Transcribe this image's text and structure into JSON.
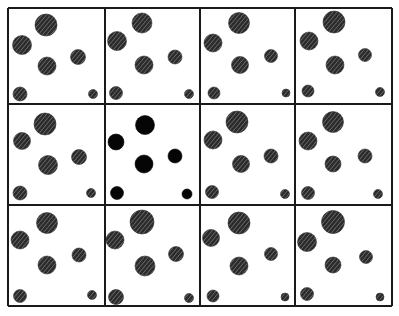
{
  "figure": {
    "rows": 3,
    "cols": 4,
    "frame": {
      "x": 8,
      "y": 8,
      "right": 392,
      "bottom": 306
    },
    "col_lines": [
      8,
      105,
      200,
      295,
      392
    ],
    "row_lines": [
      8,
      104,
      205,
      306
    ],
    "line_color": "#1a1a1a",
    "hatch_fill": "#2b2b2b",
    "hatch_stripe": "#9a9a9a",
    "solid_fill": "#050505"
  },
  "panels": [
    {
      "index": 1,
      "style": "hatched",
      "dots": [
        {
          "cx": 46,
          "cy": 25,
          "r": 11
        },
        {
          "cx": 22,
          "cy": 45,
          "r": 9.5
        },
        {
          "cx": 47,
          "cy": 66,
          "r": 9
        },
        {
          "cx": 78,
          "cy": 57,
          "r": 7.5
        },
        {
          "cx": 20,
          "cy": 94,
          "r": 7
        },
        {
          "cx": 93,
          "cy": 94,
          "r": 4.5
        }
      ]
    },
    {
      "index": 2,
      "style": "hatched",
      "dots": [
        {
          "cx": 142,
          "cy": 23,
          "r": 10
        },
        {
          "cx": 117,
          "cy": 41,
          "r": 9.5
        },
        {
          "cx": 144,
          "cy": 65,
          "r": 9
        },
        {
          "cx": 175,
          "cy": 57,
          "r": 7
        },
        {
          "cx": 116,
          "cy": 93,
          "r": 6.5
        },
        {
          "cx": 189,
          "cy": 94,
          "r": 4.5
        }
      ]
    },
    {
      "index": 3,
      "style": "hatched",
      "dots": [
        {
          "cx": 239,
          "cy": 23,
          "r": 10.5
        },
        {
          "cx": 213,
          "cy": 43,
          "r": 9
        },
        {
          "cx": 240,
          "cy": 65,
          "r": 8.5
        },
        {
          "cx": 271,
          "cy": 56,
          "r": 6.5
        },
        {
          "cx": 214,
          "cy": 93,
          "r": 6
        },
        {
          "cx": 286,
          "cy": 93,
          "r": 4
        }
      ]
    },
    {
      "index": 4,
      "style": "hatched",
      "dots": [
        {
          "cx": 334,
          "cy": 22,
          "r": 11
        },
        {
          "cx": 309,
          "cy": 41,
          "r": 9
        },
        {
          "cx": 335,
          "cy": 65,
          "r": 9
        },
        {
          "cx": 365,
          "cy": 55,
          "r": 6.5
        },
        {
          "cx": 308,
          "cy": 91,
          "r": 6
        },
        {
          "cx": 380,
          "cy": 92,
          "r": 4.5
        }
      ]
    },
    {
      "index": 5,
      "style": "hatched",
      "dots": [
        {
          "cx": 45,
          "cy": 124,
          "r": 11
        },
        {
          "cx": 22,
          "cy": 141,
          "r": 8.5
        },
        {
          "cx": 48,
          "cy": 165,
          "r": 9.5
        },
        {
          "cx": 79,
          "cy": 157,
          "r": 7.5
        },
        {
          "cx": 20,
          "cy": 193,
          "r": 7
        },
        {
          "cx": 91,
          "cy": 193,
          "r": 4.5
        }
      ]
    },
    {
      "index": 6,
      "style": "solid",
      "dots": [
        {
          "cx": 145,
          "cy": 125,
          "r": 9.5
        },
        {
          "cx": 116,
          "cy": 142,
          "r": 8
        },
        {
          "cx": 144,
          "cy": 164,
          "r": 9
        },
        {
          "cx": 175,
          "cy": 156,
          "r": 7
        },
        {
          "cx": 117,
          "cy": 193,
          "r": 6.5
        },
        {
          "cx": 187,
          "cy": 194,
          "r": 5
        }
      ]
    },
    {
      "index": 7,
      "style": "hatched",
      "dots": [
        {
          "cx": 237,
          "cy": 122,
          "r": 11
        },
        {
          "cx": 213,
          "cy": 140,
          "r": 9
        },
        {
          "cx": 241,
          "cy": 164,
          "r": 8.5
        },
        {
          "cx": 271,
          "cy": 156,
          "r": 7
        },
        {
          "cx": 212,
          "cy": 192,
          "r": 6.5
        },
        {
          "cx": 285,
          "cy": 194,
          "r": 4.5
        }
      ]
    },
    {
      "index": 8,
      "style": "hatched",
      "dots": [
        {
          "cx": 333,
          "cy": 122,
          "r": 10.5
        },
        {
          "cx": 308,
          "cy": 141,
          "r": 9
        },
        {
          "cx": 333,
          "cy": 164,
          "r": 8
        },
        {
          "cx": 365,
          "cy": 156,
          "r": 7
        },
        {
          "cx": 308,
          "cy": 193,
          "r": 6.5
        },
        {
          "cx": 378,
          "cy": 194,
          "r": 4.5
        }
      ]
    },
    {
      "index": 9,
      "style": "hatched",
      "dots": [
        {
          "cx": 47,
          "cy": 223,
          "r": 10.5
        },
        {
          "cx": 20,
          "cy": 240,
          "r": 9
        },
        {
          "cx": 47,
          "cy": 265,
          "r": 9
        },
        {
          "cx": 79,
          "cy": 255,
          "r": 7
        },
        {
          "cx": 20,
          "cy": 296,
          "r": 6.5
        },
        {
          "cx": 92,
          "cy": 295,
          "r": 4.5
        }
      ]
    },
    {
      "index": 10,
      "style": "hatched",
      "dots": [
        {
          "cx": 142,
          "cy": 222,
          "r": 12
        },
        {
          "cx": 115,
          "cy": 240,
          "r": 9
        },
        {
          "cx": 145,
          "cy": 266,
          "r": 10
        },
        {
          "cx": 176,
          "cy": 254,
          "r": 7.5
        },
        {
          "cx": 116,
          "cy": 297,
          "r": 7.5
        },
        {
          "cx": 189,
          "cy": 298,
          "r": 4.5
        }
      ]
    },
    {
      "index": 11,
      "style": "hatched",
      "dots": [
        {
          "cx": 239,
          "cy": 223,
          "r": 11
        },
        {
          "cx": 211,
          "cy": 238,
          "r": 8.5
        },
        {
          "cx": 239,
          "cy": 266,
          "r": 9
        },
        {
          "cx": 271,
          "cy": 254,
          "r": 6.5
        },
        {
          "cx": 213,
          "cy": 296,
          "r": 6
        },
        {
          "cx": 285,
          "cy": 297,
          "r": 4
        }
      ]
    },
    {
      "index": 12,
      "style": "hatched",
      "dots": [
        {
          "cx": 333,
          "cy": 222,
          "r": 11.5
        },
        {
          "cx": 307,
          "cy": 242,
          "r": 9.5
        },
        {
          "cx": 333,
          "cy": 265,
          "r": 8
        },
        {
          "cx": 366,
          "cy": 257,
          "r": 6.5
        },
        {
          "cx": 307,
          "cy": 294,
          "r": 6.5
        },
        {
          "cx": 380,
          "cy": 297,
          "r": 4
        }
      ]
    }
  ]
}
